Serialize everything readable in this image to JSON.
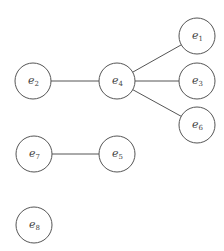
{
  "diagram": {
    "type": "undirected-graph",
    "nodes": [
      {
        "id": "e1",
        "base": "e",
        "sub": "1",
        "x": 197,
        "y": 36
      },
      {
        "id": "e2",
        "base": "e",
        "sub": "2",
        "x": 33,
        "y": 81
      },
      {
        "id": "e3",
        "base": "e",
        "sub": "3",
        "x": 197,
        "y": 81
      },
      {
        "id": "e4",
        "base": "e",
        "sub": "4",
        "x": 117,
        "y": 81
      },
      {
        "id": "e5",
        "base": "e",
        "sub": "5",
        "x": 117,
        "y": 154
      },
      {
        "id": "e6",
        "base": "e",
        "sub": "6",
        "x": 197,
        "y": 125
      },
      {
        "id": "e7",
        "base": "e",
        "sub": "7",
        "x": 34,
        "y": 154
      },
      {
        "id": "e8",
        "base": "e",
        "sub": "8",
        "x": 34,
        "y": 225
      }
    ],
    "edges": [
      {
        "from": "e2",
        "to": "e4"
      },
      {
        "from": "e4",
        "to": "e1"
      },
      {
        "from": "e4",
        "to": "e3"
      },
      {
        "from": "e4",
        "to": "e6"
      },
      {
        "from": "e7",
        "to": "e5"
      }
    ],
    "node_radius": 18,
    "colors": {
      "stroke": "#555555",
      "fill": "#ffffff",
      "text": "#444444"
    }
  }
}
